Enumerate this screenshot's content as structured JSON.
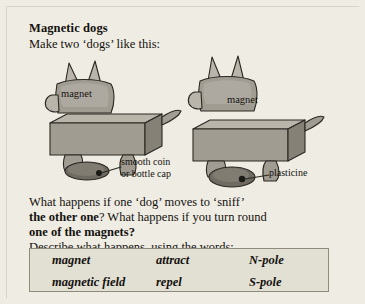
{
  "worksheet": {
    "title": "Magnetic dogs",
    "intro": "Make two ‘dogs’ like this:",
    "question_part1": "What happens if one ‘dog’ moves to ‘sniff’",
    "question_part2_a": "the other one",
    "question_part2_b": "?  What happens if you turn round",
    "question_part3_a": "one of the magnets",
    "question_part3_b": "?",
    "describe": "Describe what happens, using the words:"
  },
  "wordbank": {
    "words": [
      "magnet",
      "attract",
      "N-pole",
      "magnetic field",
      "repel",
      "S-pole"
    ]
  },
  "diagram": {
    "label_magnet_left": "magnet",
    "label_magnet_right": "magnet",
    "label_coin": "smooth coin",
    "label_coin2": "or bottle cap",
    "label_plasticine": "plasticine",
    "colors": {
      "body_light": "#b8b4aa",
      "body_mid": "#9e9a90",
      "body_dark": "#7e7a70",
      "outline": "#2a2823",
      "page_bg": "#efece3",
      "box_bg": "#e2dfd3",
      "box_border": "#8e8a7c"
    }
  }
}
